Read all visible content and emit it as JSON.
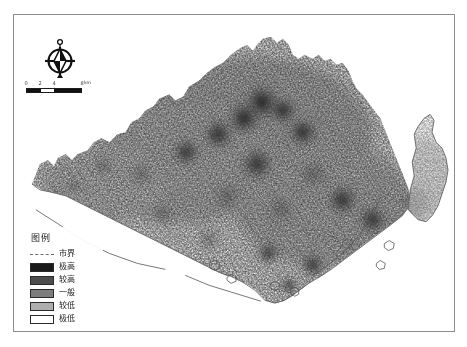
{
  "map": {
    "title": "",
    "frame": {
      "border_color": "#8d8d8d"
    },
    "boundary_label": "市界",
    "background": "#ffffff"
  },
  "compass": {
    "name": "north-arrow",
    "north_letter": "N"
  },
  "scalebar": {
    "ticks": [
      "0",
      "2",
      "4",
      "8"
    ],
    "unit": "km",
    "segments": [
      "#111111",
      "#ffffff",
      "#111111",
      "#111111"
    ]
  },
  "legend": {
    "title": "图例",
    "items": [
      {
        "label": "市界",
        "type": "line",
        "color": "#6b6b6b"
      },
      {
        "label": "极高",
        "type": "swatch",
        "color": "#1a1a1a"
      },
      {
        "label": "较高",
        "type": "swatch",
        "color": "#4d4d4d"
      },
      {
        "label": "一般",
        "type": "swatch",
        "color": "#7d7d7d"
      },
      {
        "label": "较低",
        "type": "swatch",
        "color": "#aeaeae"
      },
      {
        "label": "极低",
        "type": "swatch",
        "color": "#ffffff"
      }
    ]
  },
  "chart_data": {
    "type": "heatmap",
    "title": "",
    "xlabel": "",
    "ylabel": "",
    "legend_position": "bottom-left",
    "classes": [
      "极高",
      "较高",
      "一般",
      "较低",
      "极低"
    ],
    "class_colors": [
      "#1a1a1a",
      "#4d4d4d",
      "#7d7d7d",
      "#aeaeae",
      "#ffffff"
    ],
    "hotspots": [
      {
        "x": 249,
        "y": 88,
        "intensity": 1.0,
        "radius": 22
      },
      {
        "x": 231,
        "y": 104,
        "intensity": 0.95,
        "radius": 20
      },
      {
        "x": 270,
        "y": 96,
        "intensity": 0.85,
        "radius": 17
      },
      {
        "x": 205,
        "y": 120,
        "intensity": 0.78,
        "radius": 19
      },
      {
        "x": 290,
        "y": 118,
        "intensity": 0.8,
        "radius": 18
      },
      {
        "x": 173,
        "y": 138,
        "intensity": 0.72,
        "radius": 17
      },
      {
        "x": 244,
        "y": 150,
        "intensity": 0.7,
        "radius": 20
      },
      {
        "x": 300,
        "y": 160,
        "intensity": 0.68,
        "radius": 18
      },
      {
        "x": 128,
        "y": 160,
        "intensity": 0.62,
        "radius": 15
      },
      {
        "x": 214,
        "y": 183,
        "intensity": 0.66,
        "radius": 18
      },
      {
        "x": 268,
        "y": 196,
        "intensity": 0.64,
        "radius": 17
      },
      {
        "x": 330,
        "y": 186,
        "intensity": 0.74,
        "radius": 19
      },
      {
        "x": 360,
        "y": 206,
        "intensity": 0.72,
        "radius": 18
      },
      {
        "x": 150,
        "y": 200,
        "intensity": 0.55,
        "radius": 14
      },
      {
        "x": 196,
        "y": 226,
        "intensity": 0.58,
        "radius": 14
      },
      {
        "x": 120,
        "y": 238,
        "intensity": 0.8,
        "radius": 11
      },
      {
        "x": 255,
        "y": 240,
        "intensity": 0.7,
        "radius": 14
      },
      {
        "x": 300,
        "y": 252,
        "intensity": 0.76,
        "radius": 15
      },
      {
        "x": 340,
        "y": 256,
        "intensity": 0.72,
        "radius": 14
      },
      {
        "x": 368,
        "y": 246,
        "intensity": 0.66,
        "radius": 13
      },
      {
        "x": 276,
        "y": 272,
        "intensity": 0.72,
        "radius": 11
      },
      {
        "x": 318,
        "y": 276,
        "intensity": 0.6,
        "radius": 10
      },
      {
        "x": 413,
        "y": 160,
        "intensity": 0.4,
        "radius": 12
      },
      {
        "x": 398,
        "y": 186,
        "intensity": 0.66,
        "radius": 12
      },
      {
        "x": 60,
        "y": 172,
        "intensity": 0.42,
        "radius": 11
      },
      {
        "x": 90,
        "y": 152,
        "intensity": 0.5,
        "radius": 13
      }
    ]
  }
}
